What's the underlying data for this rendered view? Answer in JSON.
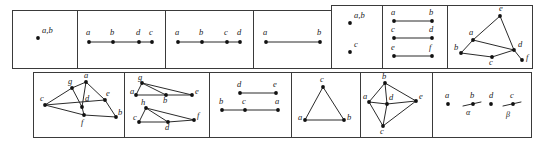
{
  "figure": {
    "background": "#ffffff",
    "border_color": "#3a3a3a",
    "edge_color": "#2b2b2b",
    "node_color": "#111111",
    "label_color": "#1a1a1a",
    "rows": [
      {
        "name": "top-row",
        "cell_count": 7
      },
      {
        "name": "bottom-row",
        "cell_count": 6
      }
    ],
    "cells": [
      {
        "id": "cell-1",
        "row": "top",
        "box": {
          "x": 12,
          "y": 10,
          "w": 65,
          "h": 58
        },
        "nodes": [
          {
            "label": "a,b",
            "x": 38,
            "y": 38,
            "lx": 42,
            "ly": 33
          }
        ],
        "edges": [],
        "edge_labels": []
      },
      {
        "id": "cell-2",
        "row": "top",
        "box": {
          "x": 77,
          "y": 10,
          "w": 88,
          "h": 58
        },
        "nodes": [
          {
            "label": "a",
            "x": 89,
            "y": 42,
            "lx": 86,
            "ly": 35
          },
          {
            "label": "b",
            "x": 113,
            "y": 42,
            "lx": 110,
            "ly": 35
          },
          {
            "label": "d",
            "x": 139,
            "y": 42,
            "lx": 136,
            "ly": 35
          },
          {
            "label": "c",
            "x": 152,
            "y": 42,
            "lx": 149,
            "ly": 35
          }
        ],
        "edges": [
          [
            0,
            1
          ],
          [
            1,
            2
          ],
          [
            2,
            3
          ]
        ],
        "edge_labels": []
      },
      {
        "id": "cell-3",
        "row": "top",
        "box": {
          "x": 165,
          "y": 10,
          "w": 88,
          "h": 58
        },
        "nodes": [
          {
            "label": "a",
            "x": 178,
            "y": 42,
            "lx": 175,
            "ly": 35
          },
          {
            "label": "b",
            "x": 202,
            "y": 42,
            "lx": 199,
            "ly": 35
          },
          {
            "label": "c",
            "x": 227,
            "y": 42,
            "lx": 224,
            "ly": 35
          },
          {
            "label": "d",
            "x": 240,
            "y": 42,
            "lx": 237,
            "ly": 35
          }
        ],
        "edges": [
          [
            0,
            1
          ],
          [
            1,
            2
          ],
          [
            2,
            3
          ]
        ],
        "edge_labels": []
      },
      {
        "id": "cell-4",
        "row": "top",
        "box": {
          "x": 253,
          "y": 10,
          "w": 78,
          "h": 58
        },
        "nodes": [
          {
            "label": "a",
            "x": 266,
            "y": 42,
            "lx": 263,
            "ly": 35
          },
          {
            "label": "b",
            "x": 320,
            "y": 42,
            "lx": 317,
            "ly": 35
          }
        ],
        "edges": [
          [
            0,
            1
          ]
        ],
        "edge_labels": []
      },
      {
        "id": "cell-5",
        "row": "top",
        "box": {
          "x": 331,
          "y": 5,
          "w": 51,
          "h": 63
        },
        "nodes": [
          {
            "label": "a,b",
            "x": 350,
            "y": 23,
            "lx": 354,
            "ly": 18
          },
          {
            "label": "c",
            "x": 350,
            "y": 52,
            "lx": 354,
            "ly": 47
          }
        ],
        "edges": [],
        "edge_labels": []
      },
      {
        "id": "cell-6",
        "row": "top",
        "box": {
          "x": 382,
          "y": 5,
          "w": 65,
          "h": 63
        },
        "nodes": [
          {
            "label": "a",
            "x": 394,
            "y": 21,
            "lx": 391,
            "ly": 15
          },
          {
            "label": "b",
            "x": 432,
            "y": 21,
            "lx": 429,
            "ly": 15
          },
          {
            "label": "c",
            "x": 394,
            "y": 38,
            "lx": 391,
            "ly": 32
          },
          {
            "label": "d",
            "x": 432,
            "y": 38,
            "lx": 429,
            "ly": 32
          },
          {
            "label": "e",
            "x": 394,
            "y": 56,
            "lx": 391,
            "ly": 50
          },
          {
            "label": "f",
            "x": 432,
            "y": 56,
            "lx": 429,
            "ly": 50
          }
        ],
        "edges": [
          [
            0,
            1
          ],
          [
            2,
            3
          ],
          [
            4,
            5
          ]
        ],
        "edge_labels": []
      },
      {
        "id": "cell-7",
        "row": "top",
        "box": {
          "x": 447,
          "y": 5,
          "w": 85,
          "h": 63
        },
        "nodes": [
          {
            "label": "e",
            "x": 500,
            "y": 16,
            "lx": 499,
            "ly": 11
          },
          {
            "label": "a",
            "x": 473,
            "y": 40,
            "lx": 469,
            "ly": 35
          },
          {
            "label": "b",
            "x": 461,
            "y": 53,
            "lx": 454,
            "ly": 50
          },
          {
            "label": "d",
            "x": 514,
            "y": 50,
            "lx": 518,
            "ly": 47
          },
          {
            "label": "c",
            "x": 492,
            "y": 57,
            "lx": 489,
            "ly": 65
          },
          {
            "label": "f",
            "x": 522,
            "y": 60,
            "lx": 526,
            "ly": 60
          }
        ],
        "edges": [
          [
            0,
            1
          ],
          [
            0,
            3
          ],
          [
            1,
            2
          ],
          [
            1,
            3
          ],
          [
            2,
            4
          ],
          [
            4,
            3
          ],
          [
            3,
            5
          ]
        ],
        "edge_labels": []
      },
      {
        "id": "cell-8",
        "row": "bottom",
        "box": {
          "x": 33,
          "y": 72,
          "w": 91,
          "h": 65
        },
        "nodes": [
          {
            "label": "g",
            "x": 72,
            "y": 88,
            "lx": 68,
            "ly": 84
          },
          {
            "label": "a",
            "x": 86,
            "y": 82,
            "lx": 84,
            "ly": 78
          },
          {
            "label": "c",
            "x": 45,
            "y": 105,
            "lx": 40,
            "ly": 101
          },
          {
            "label": "d",
            "x": 82,
            "y": 107,
            "lx": 85,
            "ly": 101
          },
          {
            "label": "e",
            "x": 105,
            "y": 100,
            "lx": 106,
            "ly": 96
          },
          {
            "label": "f",
            "x": 84,
            "y": 115,
            "lx": 81,
            "ly": 125
          },
          {
            "label": "b",
            "x": 116,
            "y": 117,
            "lx": 118,
            "ly": 115
          }
        ],
        "edges": [
          [
            2,
            0
          ],
          [
            0,
            1
          ],
          [
            1,
            3
          ],
          [
            1,
            4
          ],
          [
            0,
            3
          ],
          [
            2,
            4
          ],
          [
            2,
            5
          ],
          [
            3,
            5
          ],
          [
            4,
            6
          ],
          [
            5,
            6
          ]
        ],
        "edge_labels": []
      },
      {
        "id": "cell-9",
        "row": "bottom",
        "box": {
          "x": 124,
          "y": 72,
          "w": 85,
          "h": 65
        },
        "nodes": [
          {
            "label": "g",
            "x": 142,
            "y": 83,
            "lx": 138,
            "ly": 80
          },
          {
            "label": "a",
            "x": 136,
            "y": 95,
            "lx": 130,
            "ly": 94
          },
          {
            "label": "b",
            "x": 166,
            "y": 95,
            "lx": 163,
            "ly": 103
          },
          {
            "label": "e",
            "x": 192,
            "y": 95,
            "lx": 195,
            "ly": 94
          },
          {
            "label": "h",
            "x": 146,
            "y": 108,
            "lx": 141,
            "ly": 105
          },
          {
            "label": "c",
            "x": 139,
            "y": 122,
            "lx": 133,
            "ly": 120
          },
          {
            "label": "d",
            "x": 168,
            "y": 122,
            "lx": 165,
            "ly": 130
          },
          {
            "label": "f",
            "x": 194,
            "y": 120,
            "lx": 197,
            "ly": 118
          }
        ],
        "edges": [
          [
            0,
            1
          ],
          [
            0,
            2
          ],
          [
            0,
            3
          ],
          [
            1,
            2
          ],
          [
            2,
            3
          ],
          [
            4,
            5
          ],
          [
            4,
            6
          ],
          [
            4,
            7
          ],
          [
            5,
            6
          ],
          [
            6,
            7
          ]
        ],
        "edge_labels": []
      },
      {
        "id": "cell-10",
        "row": "bottom",
        "box": {
          "x": 209,
          "y": 72,
          "w": 82,
          "h": 65
        },
        "nodes": [
          {
            "label": "d",
            "x": 240,
            "y": 93,
            "lx": 237,
            "ly": 87
          },
          {
            "label": "e",
            "x": 276,
            "y": 93,
            "lx": 273,
            "ly": 87
          },
          {
            "label": "b",
            "x": 222,
            "y": 110,
            "lx": 219,
            "ly": 104
          },
          {
            "label": "c",
            "x": 245,
            "y": 110,
            "lx": 242,
            "ly": 104
          },
          {
            "label": "a",
            "x": 278,
            "y": 110,
            "lx": 275,
            "ly": 104
          }
        ],
        "edges": [
          [
            0,
            1
          ],
          [
            2,
            3
          ],
          [
            3,
            4
          ]
        ],
        "edge_labels": []
      },
      {
        "id": "cell-11",
        "row": "bottom",
        "box": {
          "x": 291,
          "y": 72,
          "w": 69,
          "h": 65
        },
        "nodes": [
          {
            "label": "c",
            "x": 323,
            "y": 87,
            "lx": 320,
            "ly": 82
          },
          {
            "label": "a",
            "x": 305,
            "y": 120,
            "lx": 298,
            "ly": 120
          },
          {
            "label": "b",
            "x": 344,
            "y": 120,
            "lx": 347,
            "ly": 120
          }
        ],
        "edges": [
          [
            0,
            1
          ],
          [
            0,
            2
          ],
          [
            1,
            2
          ]
        ],
        "edge_labels": []
      },
      {
        "id": "cell-12",
        "row": "bottom",
        "box": {
          "x": 360,
          "y": 72,
          "w": 72,
          "h": 65
        },
        "nodes": [
          {
            "label": "b",
            "x": 385,
            "y": 83,
            "lx": 382,
            "ly": 79
          },
          {
            "label": "a",
            "x": 369,
            "y": 102,
            "lx": 363,
            "ly": 99
          },
          {
            "label": "d",
            "x": 387,
            "y": 104,
            "lx": 389,
            "ly": 100
          },
          {
            "label": "e",
            "x": 416,
            "y": 101,
            "lx": 419,
            "ly": 99
          },
          {
            "label": "c",
            "x": 383,
            "y": 126,
            "lx": 380,
            "ly": 134
          }
        ],
        "edges": [
          [
            0,
            1
          ],
          [
            0,
            2
          ],
          [
            0,
            3
          ],
          [
            1,
            2
          ],
          [
            1,
            4
          ],
          [
            2,
            3
          ],
          [
            2,
            4
          ],
          [
            3,
            4
          ]
        ],
        "edge_labels": []
      },
      {
        "id": "cell-13",
        "row": "bottom",
        "box": {
          "x": 432,
          "y": 72,
          "w": 99,
          "h": 65
        },
        "nodes": [
          {
            "label": "a",
            "x": 448,
            "y": 104,
            "lx": 445,
            "ly": 98
          },
          {
            "label": "b",
            "x": 473,
            "y": 104,
            "lx": 470,
            "ly": 98
          },
          {
            "label": "d",
            "x": 491,
            "y": 104,
            "lx": 489,
            "ly": 98
          },
          {
            "label": "c",
            "x": 513,
            "y": 104,
            "lx": 510,
            "ly": 98
          }
        ],
        "edges": [],
        "segments": [
          {
            "x1": 463,
            "y1": 106,
            "x2": 481,
            "y2": 102
          },
          {
            "x1": 503,
            "y1": 106,
            "x2": 521,
            "y2": 102
          }
        ],
        "edge_labels": [
          {
            "text": "α",
            "x": 466,
            "y": 115
          },
          {
            "text": "β",
            "x": 506,
            "y": 117
          }
        ]
      }
    ]
  }
}
